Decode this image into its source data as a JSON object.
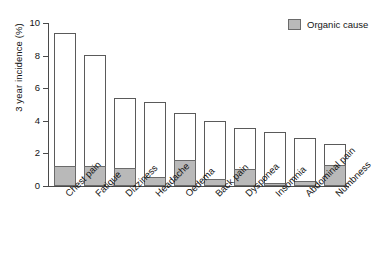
{
  "chart_data": {
    "type": "bar",
    "title": "",
    "xlabel": "",
    "ylabel": "3 year incidence (%)",
    "ylim": [
      0,
      10
    ],
    "yticks": [
      0,
      2,
      4,
      6,
      8,
      10
    ],
    "ytick_labels": [
      "0",
      "2",
      "4",
      "6",
      "8",
      "10"
    ],
    "grid": false,
    "legend_position": "top-right",
    "stacked": true,
    "categories": [
      "Chest pain",
      "Fatigue",
      "Dizziness",
      "Headache",
      "Oedema",
      "Back pain",
      "Dysponea",
      "Insomnia",
      "Abdominal pain",
      "Numbness"
    ],
    "series": [
      {
        "name": "Total",
        "color": "#ffffff",
        "values": [
          9.4,
          8.05,
          5.4,
          5.15,
          4.45,
          4.0,
          3.55,
          3.3,
          2.95,
          2.6
        ]
      },
      {
        "name": "Organic cause",
        "color": "#b9b9b9",
        "values": [
          1.2,
          1.25,
          1.1,
          0.55,
          1.6,
          0.4,
          1.05,
          0.2,
          0.3,
          1.3
        ]
      }
    ]
  },
  "legend": {
    "entries": [
      {
        "label": "Organic cause",
        "color": "#b9b9b9"
      }
    ]
  },
  "colors": {
    "organic_fill": "#b9b9b9",
    "bar_outline": "#5a5a5a",
    "axis": "#4a4a4a",
    "text": "#141414",
    "background": "#ffffff"
  }
}
